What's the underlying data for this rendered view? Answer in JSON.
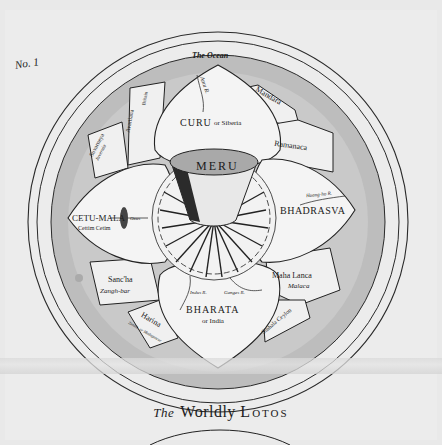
{
  "plate_number": "No. 1",
  "caption": {
    "prefix": "The",
    "word1": "Worldly",
    "word2": "Lotos"
  },
  "colors": {
    "paper": "#ececec",
    "ocean_ring": "#bdbdbd",
    "petal_fill": "#f2f2f2",
    "ink": "#1b1b1b"
  },
  "map": {
    "ocean": "The Ocean",
    "center": "MERU",
    "petals": [
      {
        "name": "CURU",
        "alt": "or Siberia",
        "river": "Amu R."
      },
      {
        "name": "BHADRASVA",
        "river": "Hoang-ho R."
      },
      {
        "name": "BHARATA",
        "alt": "or India",
        "rivers": [
          "Indus R.",
          "Ganges R.",
          "Sindhu R."
        ]
      },
      {
        "name": "CETU-MALA",
        "alt": "Cettim Cetim",
        "river": "Oxus"
      }
    ],
    "islands": [
      {
        "name": "Mandara"
      },
      {
        "name": "Ramanaca"
      },
      {
        "name": "Maha Lanca",
        "alt": "Malaca"
      },
      {
        "name": "Sinhala Ceylon"
      },
      {
        "name": "Harina",
        "alt": "Zanzib. or Madagascar"
      },
      {
        "name": "Sanc'ha",
        "alt": "Zangh-bar"
      },
      {
        "name": "Suvarneya",
        "alt": "Juvernia"
      },
      {
        "name": "Avartiana",
        "alt": "Britain"
      }
    ]
  }
}
